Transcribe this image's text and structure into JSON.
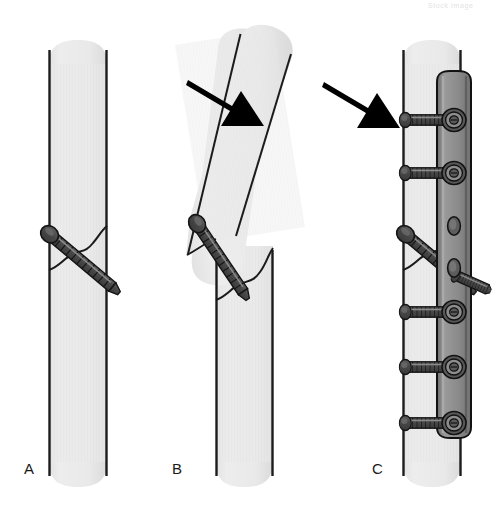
{
  "figure": {
    "background_color": "#ffffff",
    "width": 504,
    "height": 514
  },
  "watermark": {
    "text": "Stock Image",
    "visible": true
  },
  "colors": {
    "bone_fill": "#e9e9e9",
    "bone_fill_shadow": "#dcdcdc",
    "bone_outline": "#1a1a1a",
    "fracture_line": "#1a1a1a",
    "screw_body": "#4a4a4a",
    "screw_outline": "#1a1a1a",
    "screw_highlight": "#6e6e6e",
    "plate_face": "#8e8e8e",
    "plate_edge": "#6b6b6b",
    "plate_outline": "#1a1a1a",
    "arrow_fill": "#000000",
    "label_color": "#1a1a1a"
  },
  "panels": [
    {
      "id": "panel-a",
      "label": "A",
      "label_x": 24,
      "label_y": 474,
      "caption": "Lag screw placed across oblique fracture",
      "elements": {
        "bone_segments": 1,
        "fracture_lines": 1,
        "lag_screws": 1,
        "plates": 0,
        "arrows": 0
      }
    },
    {
      "id": "panel-b",
      "label": "B",
      "label_x": 172,
      "label_y": 474,
      "caption": "Rotational displacement of proximal fragment about the lag screw",
      "elements": {
        "bone_segments": 2,
        "fracture_lines": 1,
        "lag_screws": 1,
        "plates": 0,
        "arrows": 1
      }
    },
    {
      "id": "panel-c",
      "label": "C",
      "label_x": 372,
      "label_y": 474,
      "caption": "Neutralization plate added to protect the lag screw",
      "elements": {
        "bone_segments": 1,
        "fracture_lines": 1,
        "lag_screws": 1,
        "plates": 1,
        "plate_screws": 6,
        "arrows": 1
      }
    }
  ],
  "arrows": [
    {
      "id": "arrow-a-to-b",
      "name": "force-arrow-left",
      "from_x": 190,
      "from_y": 84,
      "to_x": 264,
      "to_y": 130,
      "direction": "down-right"
    },
    {
      "id": "arrow-b-to-c",
      "name": "force-arrow-right",
      "from_x": 326,
      "from_y": 86,
      "to_x": 398,
      "to_y": 132,
      "direction": "down-right"
    }
  ],
  "plate": {
    "name": "neutralization-plate",
    "screw_hole_count": 6,
    "top_y": 73,
    "bottom_y": 437,
    "left_x": 437,
    "right_x": 470
  }
}
